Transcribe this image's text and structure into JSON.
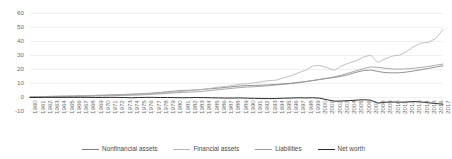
{
  "chart_data": {
    "type": "line",
    "title": "",
    "subtitle": "",
    "xlabel": "",
    "ylabel": "",
    "ylim": [
      -10,
      60
    ],
    "yticks": [
      -10,
      0,
      10,
      20,
      30,
      40,
      50,
      60
    ],
    "ytick_labels": [
      "-10",
      "0",
      "10",
      "20",
      "30",
      "40",
      "50",
      "60"
    ],
    "grid": true,
    "grid_axis": "y",
    "legend_position": "bottom",
    "x": [
      1960,
      1961,
      1962,
      1963,
      1964,
      1965,
      1966,
      1967,
      1968,
      1969,
      1970,
      1971,
      1972,
      1973,
      1974,
      1975,
      1976,
      1977,
      1978,
      1979,
      1980,
      1981,
      1982,
      1983,
      1984,
      1985,
      1986,
      1987,
      1988,
      1989,
      1990,
      1991,
      1992,
      1993,
      1994,
      1995,
      1996,
      1997,
      1998,
      1999,
      2000,
      2001,
      2002,
      2003,
      2004,
      2005,
      2006,
      2007,
      2008,
      2009,
      2010,
      2011,
      2012,
      2013,
      2014,
      2015,
      2016,
      2017
    ],
    "xtick_labels": [
      "1960",
      "1961",
      "1962",
      "1963",
      "1964",
      "1965",
      "1966",
      "1967",
      "1968",
      "1969",
      "1970",
      "1971",
      "1972",
      "1973",
      "1974",
      "1975",
      "1976",
      "1977",
      "1978",
      "1979",
      "1980",
      "1981",
      "1982",
      "1983",
      "1984",
      "1985",
      "1986",
      "1987",
      "1988",
      "1989",
      "1990",
      "1991",
      "1992",
      "1993",
      "1994",
      "1995",
      "1996",
      "1997",
      "1998",
      "1999",
      "2000",
      "2001",
      "2002",
      "2003",
      "2004",
      "2005",
      "2006",
      "2007",
      "2008",
      "2009",
      "2010",
      "2011",
      "2012",
      "2013",
      "2014",
      "2015",
      "2016",
      "2017"
    ],
    "series": [
      {
        "name": "Nonfinancial assets",
        "color": "#808080",
        "width": 0.85,
        "values": [
          0.5,
          0.6,
          0.7,
          0.8,
          0.9,
          1.0,
          1.1,
          1.2,
          1.4,
          1.5,
          1.6,
          1.8,
          2.0,
          2.2,
          2.4,
          2.6,
          2.9,
          3.2,
          3.6,
          4.1,
          4.6,
          5.0,
          5.2,
          5.5,
          5.9,
          6.3,
          6.7,
          7.2,
          7.7,
          8.2,
          8.5,
          8.6,
          8.8,
          9.0,
          9.4,
          9.8,
          10.2,
          10.8,
          11.4,
          12.1,
          12.9,
          13.6,
          14.3,
          15.2,
          16.4,
          18.0,
          19.2,
          19.6,
          18.6,
          17.8,
          17.6,
          17.7,
          18.2,
          19.0,
          19.9,
          20.8,
          21.7,
          22.6
        ]
      },
      {
        "name": "Financial assets",
        "color": "#b5b5b5",
        "width": 0.85,
        "values": [
          0.6,
          0.7,
          0.7,
          0.8,
          0.9,
          1.0,
          1.1,
          1.3,
          1.4,
          1.5,
          1.6,
          1.8,
          2.0,
          2.1,
          2.1,
          2.4,
          2.7,
          2.9,
          3.2,
          3.6,
          4.1,
          4.4,
          4.8,
          5.4,
          5.8,
          6.6,
          7.4,
          7.9,
          8.6,
          9.5,
          9.8,
          10.6,
          11.3,
          12.1,
          12.4,
          14.0,
          15.5,
          17.6,
          19.4,
          22.5,
          22.9,
          21.3,
          19.4,
          22.6,
          24.6,
          26.2,
          28.8,
          30.3,
          25.1,
          27.6,
          29.6,
          30.3,
          32.9,
          36.5,
          38.9,
          39.4,
          42.2,
          48.5
        ]
      },
      {
        "name": "Liabilities",
        "color": "#9a9a9a",
        "width": 0.85,
        "values": [
          0.3,
          0.4,
          0.4,
          0.5,
          0.6,
          0.7,
          0.7,
          0.8,
          0.9,
          1.0,
          1.1,
          1.2,
          1.4,
          1.5,
          1.6,
          1.8,
          2.0,
          2.3,
          2.6,
          3.0,
          3.3,
          3.6,
          3.8,
          4.1,
          4.5,
          5.1,
          5.6,
          6.1,
          6.6,
          7.1,
          7.5,
          7.7,
          8.0,
          8.4,
          8.9,
          9.4,
          9.9,
          10.5,
          11.2,
          12.1,
          12.9,
          13.8,
          14.8,
          16.0,
          17.5,
          19.1,
          20.6,
          21.8,
          21.6,
          20.9,
          20.4,
          20.3,
          20.5,
          20.9,
          21.5,
          22.2,
          23.0,
          23.9
        ]
      },
      {
        "name": "Net worth",
        "color": "#2b2b2b",
        "width": 1.0,
        "values": [
          0.0,
          0.0,
          0.1,
          0.1,
          0.1,
          0.1,
          0.1,
          0.1,
          0.1,
          0.0,
          0.0,
          0.1,
          0.1,
          0.0,
          -0.2,
          0.0,
          0.1,
          0.1,
          0.0,
          0.0,
          -0.1,
          -0.2,
          -0.1,
          0.0,
          -0.1,
          -0.2,
          -0.3,
          -0.4,
          -0.4,
          -0.3,
          -0.5,
          -0.6,
          -0.7,
          -0.8,
          -0.7,
          -0.5,
          -0.4,
          -0.2,
          -0.3,
          -0.2,
          -0.5,
          -1.6,
          -2.6,
          -2.5,
          -2.2,
          -1.9,
          -1.6,
          -1.9,
          -4.0,
          -3.4,
          -3.2,
          -3.4,
          -3.2,
          -2.9,
          -3.2,
          -3.8,
          -4.3,
          -4.8
        ]
      }
    ]
  }
}
